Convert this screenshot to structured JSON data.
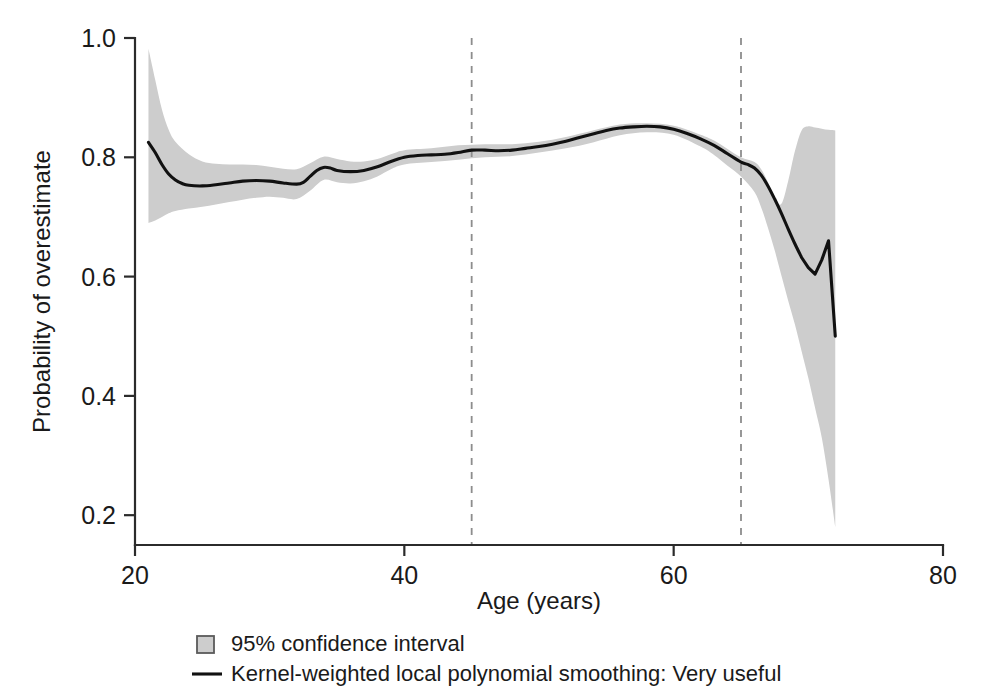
{
  "chart_data": {
    "type": "line",
    "title": "",
    "subtitle": "",
    "xlabel": "Age (years)",
    "ylabel": "Probability of overestimate",
    "xlim": [
      20,
      80
    ],
    "ylim": [
      0.15,
      1.0
    ],
    "xticks": [
      20,
      40,
      60,
      80
    ],
    "xtick_labels": [
      "20",
      "40",
      "60",
      "80"
    ],
    "yticks": [
      0.2,
      0.4,
      0.6,
      0.8,
      1.0
    ],
    "ytick_labels": [
      "0.2",
      "0.4",
      "0.6",
      "0.8",
      "1.0"
    ],
    "grid": false,
    "legend_position": "below-axes",
    "legend": [
      {
        "marker": "filled-square",
        "label": "95% confidence interval",
        "color": "#cdcdcd"
      },
      {
        "marker": "line",
        "label": "Kernel-weighted local polynomial smoothing: Very useful",
        "color": "#111111"
      }
    ],
    "annotations": [
      {
        "type": "vertical-dashed-line",
        "x": 45,
        "label": ""
      },
      {
        "type": "vertical-dashed-line",
        "x": 65,
        "label": ""
      }
    ],
    "series": [
      {
        "name": "Kernel-weighted local polynomial smoothing: Very useful",
        "type": "line",
        "color": "#111111",
        "x": [
          21.0,
          21.5,
          22.0,
          22.5,
          23.0,
          23.5,
          24.0,
          25.0,
          26.0,
          27.0,
          28.0,
          29.0,
          30.0,
          31.0,
          32.0,
          32.5,
          33.0,
          33.5,
          34.0,
          34.5,
          35.0,
          36.0,
          37.0,
          38.0,
          39.0,
          40.0,
          41.0,
          42.0,
          43.0,
          44.0,
          45.0,
          46.0,
          47.0,
          48.0,
          49.0,
          50.0,
          51.0,
          52.0,
          53.0,
          54.0,
          55.0,
          56.0,
          57.0,
          58.0,
          59.0,
          60.0,
          61.0,
          62.0,
          63.0,
          64.0,
          65.0,
          65.5,
          66.0,
          66.5,
          67.0,
          67.5,
          68.0,
          68.5,
          69.0,
          69.5,
          70.0,
          70.5,
          71.0,
          71.5,
          72.0
        ],
        "y": [
          0.825,
          0.808,
          0.788,
          0.772,
          0.762,
          0.756,
          0.753,
          0.752,
          0.754,
          0.757,
          0.76,
          0.761,
          0.76,
          0.757,
          0.755,
          0.758,
          0.768,
          0.778,
          0.783,
          0.782,
          0.778,
          0.776,
          0.778,
          0.784,
          0.793,
          0.8,
          0.803,
          0.804,
          0.805,
          0.808,
          0.812,
          0.812,
          0.811,
          0.812,
          0.815,
          0.818,
          0.822,
          0.827,
          0.833,
          0.839,
          0.845,
          0.849,
          0.851,
          0.852,
          0.851,
          0.847,
          0.84,
          0.831,
          0.82,
          0.806,
          0.792,
          0.788,
          0.782,
          0.77,
          0.752,
          0.73,
          0.706,
          0.68,
          0.655,
          0.632,
          0.615,
          0.604,
          0.628,
          0.66,
          0.5
        ]
      },
      {
        "name": "95% confidence interval",
        "type": "band",
        "color": "#cdcdcd",
        "x": [
          21.0,
          21.5,
          22.0,
          22.5,
          23.0,
          24.0,
          25.0,
          26.0,
          27.0,
          28.0,
          29.0,
          30.0,
          31.0,
          32.0,
          33.0,
          34.0,
          35.0,
          36.0,
          37.0,
          38.0,
          39.0,
          40.0,
          42.0,
          44.0,
          46.0,
          48.0,
          50.0,
          52.0,
          54.0,
          56.0,
          58.0,
          60.0,
          62.0,
          63.0,
          64.0,
          65.0,
          66.0,
          66.5,
          67.0,
          67.5,
          68.0,
          68.5,
          69.0,
          69.5,
          70.0,
          70.5,
          71.0,
          71.5,
          72.0
        ],
        "upper": [
          0.982,
          0.93,
          0.88,
          0.846,
          0.826,
          0.805,
          0.793,
          0.789,
          0.788,
          0.788,
          0.787,
          0.784,
          0.781,
          0.78,
          0.79,
          0.801,
          0.797,
          0.793,
          0.793,
          0.797,
          0.805,
          0.812,
          0.815,
          0.82,
          0.822,
          0.822,
          0.826,
          0.834,
          0.845,
          0.855,
          0.857,
          0.853,
          0.838,
          0.828,
          0.814,
          0.8,
          0.792,
          0.78,
          0.758,
          0.73,
          0.722,
          0.76,
          0.81,
          0.845,
          0.852,
          0.85,
          0.848,
          0.846,
          0.845
        ],
        "lower": [
          0.69,
          0.694,
          0.7,
          0.706,
          0.71,
          0.714,
          0.717,
          0.721,
          0.725,
          0.729,
          0.732,
          0.734,
          0.732,
          0.73,
          0.744,
          0.762,
          0.758,
          0.756,
          0.76,
          0.768,
          0.78,
          0.788,
          0.792,
          0.796,
          0.8,
          0.802,
          0.808,
          0.815,
          0.825,
          0.837,
          0.842,
          0.838,
          0.818,
          0.804,
          0.786,
          0.768,
          0.742,
          0.716,
          0.682,
          0.644,
          0.602,
          0.56,
          0.52,
          0.475,
          0.43,
          0.38,
          0.33,
          0.26,
          0.18
        ]
      }
    ]
  },
  "figure": {
    "plot_left_px": 135,
    "plot_right_px": 943,
    "plot_top_px": 38,
    "plot_bottom_px": 545,
    "background_color": "#ffffff",
    "axis_color": "#2b2b2b",
    "band_color": "#cdcdcd",
    "line_color": "#111111",
    "reference_line_color": "#8d8d8d"
  }
}
